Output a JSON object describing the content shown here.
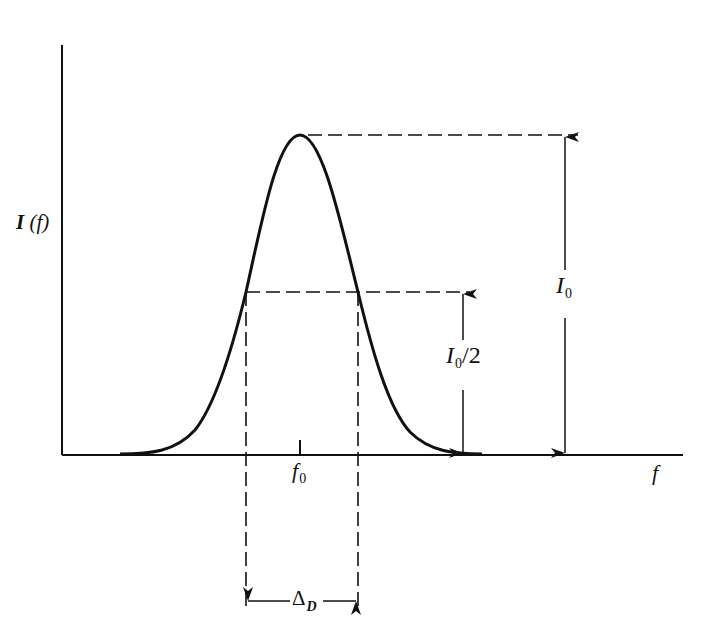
{
  "diagram": {
    "type": "gaussian-line-profile",
    "labels": {
      "y_axis": {
        "main": "I",
        "arg": "(f)"
      },
      "x_axis": "f",
      "center_frequency": {
        "main": "f",
        "sub": "0"
      },
      "peak_intensity": {
        "main": "I",
        "sub": "0"
      },
      "half_intensity": {
        "main": "I",
        "sub": "0",
        "suffix": "/2"
      },
      "width": {
        "main": "Δ",
        "sub": "D"
      }
    },
    "geometry": {
      "axis_origin": [
        62,
        455
      ],
      "y_axis_top": 45,
      "x_axis_right": 683,
      "peak": [
        300,
        135
      ],
      "half_max_y": 292,
      "half_max_left_x": 246,
      "half_max_right_x": 358,
      "peak_arrow_x": 565,
      "half_arrow_x": 463,
      "width_arrow_y": 601
    },
    "colors": {
      "ink": "#111111",
      "background": "#ffffff"
    }
  }
}
